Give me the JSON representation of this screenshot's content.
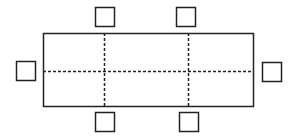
{
  "diagram": {
    "stroke_color": "#222222",
    "background": "#ffffff",
    "table": {
      "x": 43,
      "y": 33,
      "width": 210,
      "height": 73
    },
    "dividers": {
      "vertical_x": [
        104,
        188
      ],
      "horizontal_y": [
        71
      ]
    },
    "seats": [
      {
        "position": "top-left",
        "x": 95,
        "y": 7,
        "size": 19
      },
      {
        "position": "top-right",
        "x": 176,
        "y": 7,
        "size": 19
      },
      {
        "position": "left",
        "x": 16,
        "y": 61,
        "size": 19
      },
      {
        "position": "right",
        "x": 262,
        "y": 62,
        "size": 19
      },
      {
        "position": "bottom-left",
        "x": 95,
        "y": 112,
        "size": 19
      },
      {
        "position": "bottom-right",
        "x": 179,
        "y": 112,
        "size": 19
      }
    ]
  }
}
